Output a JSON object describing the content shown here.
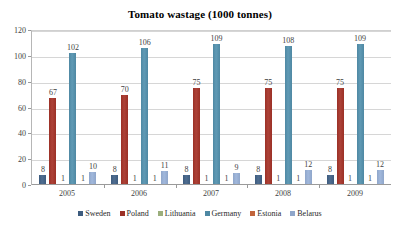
{
  "chart_data": {
    "type": "bar",
    "title": "Tomato wastage (1000 tonnes)",
    "xlabel": "",
    "ylabel": "",
    "ylim": [
      0,
      120
    ],
    "ytick_step": 20,
    "yticks": [
      "0",
      "20",
      "40",
      "60",
      "80",
      "100",
      "120"
    ],
    "grid": true,
    "legend_position": "bottom",
    "categories": [
      "2005",
      "2006",
      "2007",
      "2008",
      "2009"
    ],
    "series": [
      {
        "name": "Sweden",
        "color": "#3D5B7E",
        "values": [
          8,
          8,
          8,
          8,
          8
        ]
      },
      {
        "name": "Poland",
        "color": "#9B3026",
        "values": [
          67,
          70,
          75,
          75,
          75
        ]
      },
      {
        "name": "Lithuania",
        "color": "#9BAE7C",
        "values": [
          1,
          1,
          1,
          1,
          1
        ]
      },
      {
        "name": "Germany",
        "color": "#4E88A3",
        "values": [
          102,
          106,
          109,
          108,
          109
        ]
      },
      {
        "name": "Estonia",
        "color": "#C1643B",
        "values": [
          1,
          1,
          1,
          1,
          1
        ]
      },
      {
        "name": "Belarus",
        "color": "#8FA6CA",
        "values": [
          10,
          11,
          9,
          12,
          12
        ]
      }
    ]
  }
}
